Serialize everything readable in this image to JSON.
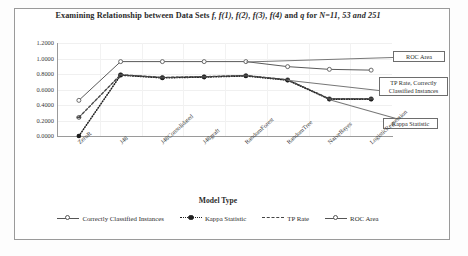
{
  "chart_data": {
    "type": "line",
    "title": "Examining Relationship between Data Sets f, f(1), f(2), f(3), f(4) and q for N=11, 53 and 251",
    "title_parts": {
      "seg1": "Examining Relationship between Data Sets ",
      "seg2_italic": "f, f(1), f(2), f(3), f(4)",
      "seg3": " and ",
      "seg4_italic": "q",
      "seg5": " for ",
      "seg6_italic": "N=11, 53 and 251"
    },
    "xlabel": "Model Type",
    "ylabel": "Ratio",
    "ylim": [
      0.0,
      1.2
    ],
    "ytick_labels": [
      "1.2000",
      "1.0000",
      "0.8000",
      "0.6000",
      "0.4000",
      "0.2000",
      "0.0000"
    ],
    "ytick_values": [
      1.2,
      1.0,
      0.8,
      0.6,
      0.4,
      0.2,
      0.0
    ],
    "grid": true,
    "legend_position": "bottom",
    "categories": [
      "ZeroR",
      "J48",
      "J48Consolidated",
      "J48graft",
      "RandomForest",
      "RandomTree",
      "NaiveBayes",
      "LogisticRegression"
    ],
    "series": [
      {
        "name": "Correctly Classified Instances",
        "marker": "open-circle",
        "line_style": "solid",
        "values": [
          0.24,
          0.79,
          0.755,
          0.765,
          0.78,
          0.725,
          0.48,
          0.48
        ]
      },
      {
        "name": "Kappa Statistic",
        "marker": "filled-circle",
        "line_style": "dotted",
        "values": [
          0.0,
          0.785,
          0.75,
          0.76,
          0.775,
          0.72,
          0.475,
          0.475
        ]
      },
      {
        "name": "TP Rate",
        "marker": "dash",
        "line_style": "dashed",
        "values": [
          0.24,
          0.79,
          0.755,
          0.765,
          0.78,
          0.725,
          0.48,
          0.48
        ]
      },
      {
        "name": "ROC Area",
        "marker": "open-circle",
        "line_style": "solid",
        "values": [
          0.46,
          0.96,
          0.96,
          0.96,
          0.96,
          0.895,
          0.86,
          0.85
        ]
      }
    ],
    "annotations": [
      {
        "name": "roc-area-callout",
        "text": "ROC Area",
        "points_to": "ROC Area series"
      },
      {
        "name": "tp-rate-cci-callout",
        "text": "TP Rate, Correctly Classified Instances",
        "points_to": "TP Rate and Correctly Classified Instances series"
      },
      {
        "name": "kappa-statistic-callout",
        "text": "Kappa Statistic",
        "points_to": "Kappa Statistic series"
      }
    ]
  },
  "legend": {
    "items": [
      {
        "label": "Correctly Classified Instances"
      },
      {
        "label": "Kappa Statistic"
      },
      {
        "label": "TP Rate"
      },
      {
        "label": "ROC Area"
      }
    ]
  },
  "callouts": {
    "roc": "ROC Area",
    "tpr_line1": "TP Rate, Correctly",
    "tpr_line2": "Classified Instances",
    "kappa": "Kappa Statistic"
  }
}
